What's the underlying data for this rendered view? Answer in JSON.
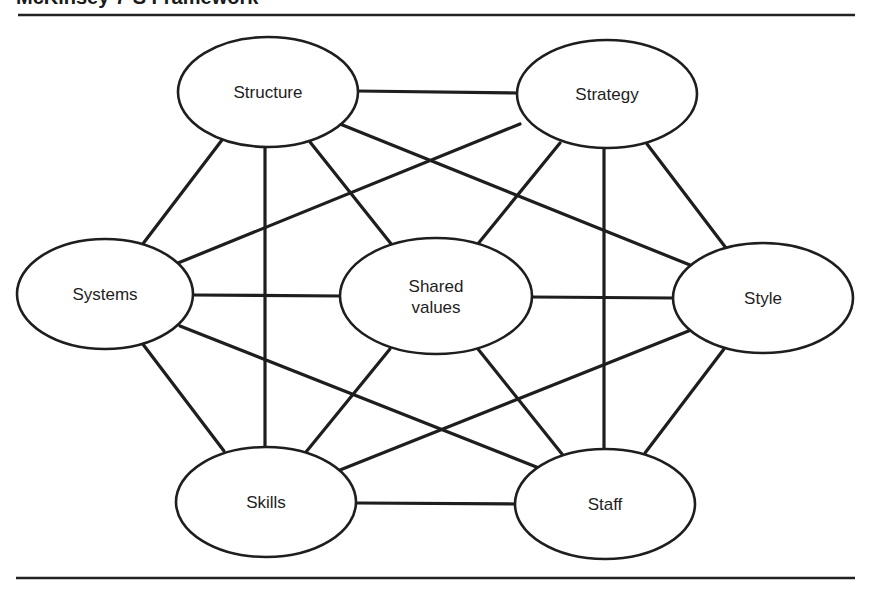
{
  "title": "McKinsey 7-S Framework",
  "nodes": [
    {
      "id": "structure",
      "label": "Structure",
      "cx": 268,
      "cy": 92,
      "rx": 90,
      "ry": 55
    },
    {
      "id": "strategy",
      "label": "Strategy",
      "cx": 607,
      "cy": 94,
      "rx": 90,
      "ry": 54
    },
    {
      "id": "systems",
      "label": "Systems",
      "cx": 105,
      "cy": 294,
      "rx": 88,
      "ry": 55
    },
    {
      "id": "shared-values",
      "label": "Shared values",
      "lines": [
        "Shared",
        "values"
      ],
      "cx": 436,
      "cy": 296,
      "rx": 96,
      "ry": 58
    },
    {
      "id": "style",
      "label": "Style",
      "cx": 763,
      "cy": 298,
      "rx": 90,
      "ry": 55
    },
    {
      "id": "skills",
      "label": "Skills",
      "cx": 266,
      "cy": 502,
      "rx": 90,
      "ry": 55
    },
    {
      "id": "staff",
      "label": "Staff",
      "cx": 605,
      "cy": 504,
      "rx": 90,
      "ry": 55
    }
  ],
  "edges": [
    {
      "from": "structure",
      "to": "strategy",
      "x1": 357,
      "y1": 91,
      "x2": 518,
      "y2": 93
    },
    {
      "from": "structure",
      "to": "systems",
      "x1": 222,
      "y1": 140,
      "x2": 142,
      "y2": 245
    },
    {
      "from": "structure",
      "to": "skills",
      "x1": 265,
      "y1": 147,
      "x2": 265,
      "y2": 448
    },
    {
      "from": "structure",
      "to": "shared-values",
      "x1": 310,
      "y1": 142,
      "x2": 392,
      "y2": 245
    },
    {
      "from": "structure",
      "to": "style",
      "x1": 340,
      "y1": 124,
      "x2": 690,
      "y2": 265
    },
    {
      "from": "structure",
      "to": "staff",
      "x1": 218,
      "y1": 140,
      "x2": 215,
      "y2": 140
    },
    {
      "from": "strategy",
      "to": "systems",
      "x1": 520,
      "y1": 124,
      "x2": 178,
      "y2": 263
    },
    {
      "from": "strategy",
      "to": "shared-values",
      "x1": 560,
      "y1": 143,
      "x2": 477,
      "y2": 245
    },
    {
      "from": "strategy",
      "to": "staff",
      "x1": 604,
      "y1": 149,
      "x2": 604,
      "y2": 450
    },
    {
      "from": "strategy",
      "to": "style",
      "x1": 647,
      "y1": 144,
      "x2": 726,
      "y2": 248
    },
    {
      "from": "systems",
      "to": "shared-values",
      "x1": 193,
      "y1": 295,
      "x2": 341,
      "y2": 296
    },
    {
      "from": "systems",
      "to": "skills",
      "x1": 142,
      "y1": 343,
      "x2": 224,
      "y2": 451
    },
    {
      "from": "systems",
      "to": "staff",
      "x1": 180,
      "y1": 326,
      "x2": 544,
      "y2": 470
    },
    {
      "from": "shared-values",
      "to": "style",
      "x1": 531,
      "y1": 297,
      "x2": 674,
      "y2": 298
    },
    {
      "from": "shared-values",
      "to": "skills",
      "x1": 390,
      "y1": 349,
      "x2": 306,
      "y2": 452
    },
    {
      "from": "shared-values",
      "to": "staff",
      "x1": 478,
      "y1": 349,
      "x2": 562,
      "y2": 454
    },
    {
      "from": "style",
      "to": "skills",
      "x1": 691,
      "y1": 330,
      "x2": 340,
      "y2": 470
    },
    {
      "from": "style",
      "to": "staff",
      "x1": 724,
      "y1": 349,
      "x2": 645,
      "y2": 453
    },
    {
      "from": "skills",
      "to": "staff",
      "x1": 356,
      "y1": 503,
      "x2": 516,
      "y2": 504
    }
  ],
  "rules": [
    {
      "x1": 18,
      "y1": 15,
      "x2": 855,
      "y2": 15
    },
    {
      "x1": 16,
      "y1": 578,
      "x2": 855,
      "y2": 578
    }
  ],
  "colors": {
    "stroke": "#1e1e1e",
    "background": "#ffffff"
  }
}
